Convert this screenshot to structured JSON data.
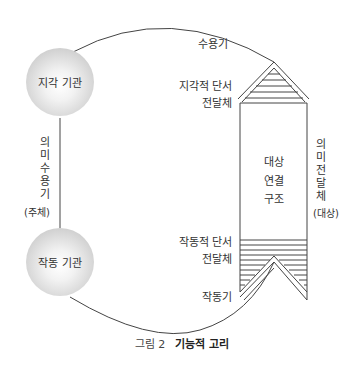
{
  "diagram": {
    "nodes": {
      "perception_organ": "지각 기관",
      "effector_organ": "작동 기관"
    },
    "left_axis": {
      "label": "의미수용기",
      "qualifier": "(주체)"
    },
    "right_axis": {
      "label": "의미전달체",
      "qualifier": "(대상)"
    },
    "labels": {
      "receptor": "수용기",
      "perceptual_cue_line1": "지각적 단서",
      "perceptual_cue_line2": "전달체",
      "object_structure_line1": "대상",
      "object_structure_line2": "연결",
      "object_structure_line3": "구조",
      "effector_cue_line1": "작동적 단서",
      "effector_cue_line2": "전달체",
      "effector": "작동기"
    },
    "caption": {
      "number": "그림 2",
      "title": "기능적 고리"
    },
    "colors": {
      "line": "#444444",
      "sphere_edge": "#b5b5b5",
      "text": "#333333"
    }
  }
}
